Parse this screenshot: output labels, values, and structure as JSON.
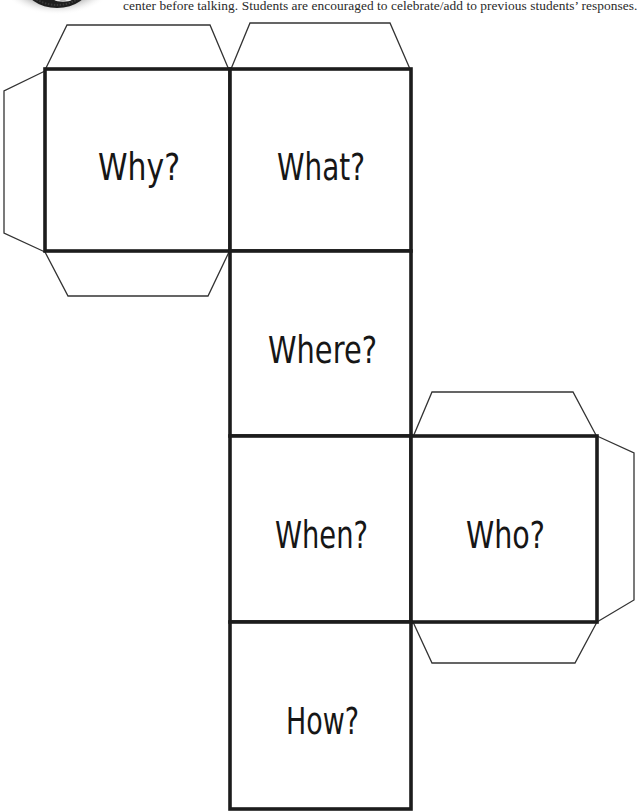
{
  "header": {
    "intro_text": "center before talking. Students are encouraged to celebrate/add to previous students’ responses.",
    "logo_icon": "badge-logo-icon"
  },
  "cube_net": {
    "faces": [
      {
        "id": "why",
        "label": "Why?"
      },
      {
        "id": "what",
        "label": "What?"
      },
      {
        "id": "where",
        "label": "Where?"
      },
      {
        "id": "when",
        "label": "When?"
      },
      {
        "id": "who",
        "label": "Who?"
      },
      {
        "id": "how",
        "label": "How?"
      }
    ],
    "tabs": [
      "why-top",
      "what-top",
      "why-left",
      "why-bottom",
      "who-top",
      "who-right",
      "who-bottom"
    ]
  },
  "colors": {
    "line": "#1c1c1c",
    "background": "#ffffff"
  }
}
